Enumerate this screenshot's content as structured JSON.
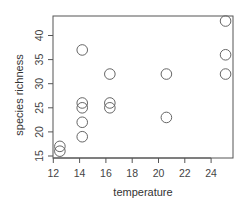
{
  "chart_data": {
    "type": "scatter",
    "title": "",
    "xlabel": "temperature",
    "ylabel": "species richness",
    "xlim": [
      12,
      25.5
    ],
    "ylim": [
      15,
      43.5
    ],
    "x_ticks": [
      12,
      14,
      16,
      18,
      20,
      22,
      24
    ],
    "y_ticks": [
      15,
      20,
      25,
      30,
      35,
      40
    ],
    "grid": false,
    "legend": null,
    "marker": "open-circle",
    "points": [
      {
        "x": 12.5,
        "y": 17
      },
      {
        "x": 12.5,
        "y": 16
      },
      {
        "x": 14.2,
        "y": 37
      },
      {
        "x": 14.2,
        "y": 26
      },
      {
        "x": 14.2,
        "y": 25
      },
      {
        "x": 14.2,
        "y": 22
      },
      {
        "x": 14.2,
        "y": 19
      },
      {
        "x": 16.3,
        "y": 32
      },
      {
        "x": 16.3,
        "y": 26
      },
      {
        "x": 16.3,
        "y": 25
      },
      {
        "x": 20.6,
        "y": 32
      },
      {
        "x": 20.6,
        "y": 23
      },
      {
        "x": 25.1,
        "y": 43
      },
      {
        "x": 25.1,
        "y": 36
      },
      {
        "x": 25.1,
        "y": 32
      }
    ]
  },
  "colors": {
    "axis": "#555555",
    "marker": "#666666",
    "text": "#444444"
  }
}
